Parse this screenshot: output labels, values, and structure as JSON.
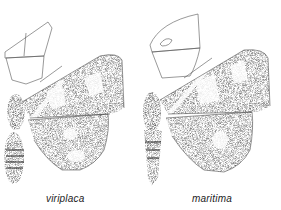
{
  "plate": {
    "background": "#ffffff",
    "ink_color": "#2a2a2a",
    "specimens": [
      {
        "name": "viriplaca",
        "caption": "viriplaca"
      },
      {
        "name": "maritima",
        "caption": "maritima"
      }
    ]
  }
}
